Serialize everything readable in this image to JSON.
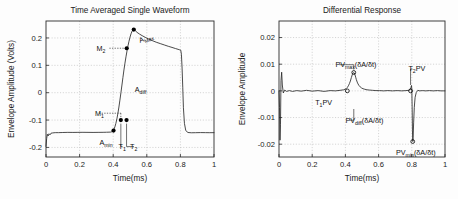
{
  "figure": {
    "panels": [
      "Time Averaged Single Waveform",
      "Differential Response"
    ]
  },
  "chart_data": [
    {
      "type": "line",
      "panel": "left",
      "title": "Time Averaged Single Waveform",
      "xlabel": "Time(ms)",
      "ylabel": "Envelope Amplitude (Volts)",
      "xlim": [
        0,
        1
      ],
      "ylim": [
        -0.235,
        0.262
      ],
      "xticks": [
        0,
        0.2,
        0.4,
        0.6,
        0.8,
        1
      ],
      "xticklabels": [
        "0",
        "0.2",
        "0.4",
        "0.6",
        "0.8",
        "1"
      ],
      "yticks": [
        -0.2,
        -0.1,
        0,
        0.1,
        0.2
      ],
      "yticklabels": [
        "-0.2",
        "-0.1",
        "0",
        "0.1",
        "0.2"
      ],
      "grid": true,
      "legend": "none",
      "series": [
        {
          "name": "envelope",
          "x": [
            0.0,
            0.004,
            0.008,
            0.013,
            0.018,
            0.024,
            0.03,
            0.04,
            0.055,
            0.075,
            0.1,
            0.13,
            0.16,
            0.19,
            0.22,
            0.25,
            0.28,
            0.31,
            0.34,
            0.36,
            0.375,
            0.385,
            0.392,
            0.398,
            0.404,
            0.41,
            0.416,
            0.422,
            0.428,
            0.434,
            0.44,
            0.446,
            0.452,
            0.458,
            0.464,
            0.47,
            0.476,
            0.482,
            0.488,
            0.494,
            0.5,
            0.506,
            0.512,
            0.518,
            0.524,
            0.532,
            0.542,
            0.556,
            0.572,
            0.59,
            0.61,
            0.632,
            0.656,
            0.68,
            0.704,
            0.728,
            0.75,
            0.77,
            0.786,
            0.796,
            0.802,
            0.806,
            0.81,
            0.814,
            0.818,
            0.824,
            0.832,
            0.845,
            0.865,
            0.89,
            0.92,
            0.95,
            0.975,
            1.0
          ],
          "y": [
            -0.196,
            -0.168,
            -0.152,
            -0.158,
            -0.15,
            -0.154,
            -0.148,
            -0.147,
            -0.146,
            -0.146,
            -0.1455,
            -0.145,
            -0.1452,
            -0.145,
            -0.1448,
            -0.145,
            -0.1452,
            -0.145,
            -0.1448,
            -0.1445,
            -0.1442,
            -0.144,
            -0.1425,
            -0.1395,
            -0.134,
            -0.125,
            -0.112,
            -0.0955,
            -0.0755,
            -0.0525,
            -0.027,
            0.0,
            0.028,
            0.056,
            0.083,
            0.108,
            0.131,
            0.152,
            0.171,
            0.188,
            0.203,
            0.215,
            0.2245,
            0.2295,
            0.2305,
            0.2265,
            0.2205,
            0.2145,
            0.2085,
            0.2025,
            0.1965,
            0.1905,
            0.1845,
            0.1795,
            0.1745,
            0.1695,
            0.1655,
            0.1615,
            0.1585,
            0.1565,
            0.1555,
            0.1405,
            0.09,
            0.02,
            -0.055,
            -0.112,
            -0.1385,
            -0.1455,
            -0.1465,
            -0.1462,
            -0.1458,
            -0.146,
            -0.1462,
            -0.146
          ],
          "color": "#2a2a2a"
        }
      ],
      "markers": [
        {
          "name": "A_min-point",
          "x": 0.402,
          "y": -0.1385,
          "style": "filled"
        },
        {
          "name": "T1-point",
          "x": 0.4455,
          "y": -0.1,
          "style": "filled"
        },
        {
          "name": "T2-point",
          "x": 0.4795,
          "y": -0.1,
          "style": "filled"
        },
        {
          "name": "M2-point",
          "x": 0.4805,
          "y": 0.1625,
          "style": "filled"
        },
        {
          "name": "A_Max-point",
          "x": 0.5225,
          "y": 0.2305,
          "style": "filled"
        }
      ],
      "annotations": [
        {
          "name": "M2",
          "base": "M",
          "sub": "2",
          "x_text": 0.3,
          "y_text": 0.1625,
          "leader_to_x": 0.4805,
          "leader_to_y": 0.1625,
          "leader": "dashed"
        },
        {
          "name": "A_Max",
          "base": "A",
          "sub": "Max",
          "x_text": 0.56,
          "y_text": 0.19,
          "leader": "none",
          "rotate": -22
        },
        {
          "name": "A_diff",
          "base": "A",
          "sub": "diff",
          "x_text": 0.528,
          "y_text": 0.012,
          "leader": "none"
        },
        {
          "name": "M1",
          "base": "M",
          "sub": "1",
          "x_text": 0.292,
          "y_text": -0.075,
          "leader_to_x": 0.4455,
          "leader_to_y": -0.1,
          "leader": "dashed"
        },
        {
          "name": "A_min",
          "base": "A",
          "sub": "min",
          "x_text": 0.318,
          "y_text": -0.182,
          "leader": "none"
        },
        {
          "name": "T1",
          "base": "T",
          "sub": "1",
          "x_text": 0.432,
          "y_text": -0.197,
          "leader_to_x": 0.4455,
          "leader_to_y": -0.113,
          "leader": "solid"
        },
        {
          "name": "T2",
          "base": "T",
          "sub": "2",
          "x_text": 0.5,
          "y_text": -0.197,
          "leader_to_x": 0.4795,
          "leader_to_y": -0.113,
          "leader": "solid"
        }
      ]
    },
    {
      "type": "line",
      "panel": "right",
      "title": "Differential Response",
      "xlabel": "Time(ms)",
      "ylabel": "Envelope Amplitude",
      "xlim": [
        0,
        1
      ],
      "ylim": [
        -0.0248,
        0.0262
      ],
      "xticks": [
        0,
        0.2,
        0.4,
        0.6,
        0.8,
        1
      ],
      "xticklabels": [
        "0",
        "0.2",
        "0.4",
        "0.6",
        "0.8",
        "1"
      ],
      "yticks": [
        -0.02,
        -0.01,
        0,
        0.01,
        0.02
      ],
      "yticklabels": [
        "-0.02",
        "-0.01",
        "0",
        "0.01",
        "0.02"
      ],
      "grid": true,
      "legend": "none",
      "series": [
        {
          "name": "derivative",
          "x": [
            0.0,
            0.003,
            0.006,
            0.009,
            0.012,
            0.016,
            0.02,
            0.026,
            0.034,
            0.046,
            0.062,
            0.082,
            0.106,
            0.134,
            0.166,
            0.2,
            0.236,
            0.272,
            0.308,
            0.34,
            0.368,
            0.39,
            0.404,
            0.412,
            0.418,
            0.424,
            0.43,
            0.436,
            0.441,
            0.446,
            0.45,
            0.454,
            0.458,
            0.462,
            0.466,
            0.471,
            0.476,
            0.482,
            0.489,
            0.497,
            0.506,
            0.517,
            0.53,
            0.546,
            0.564,
            0.584,
            0.606,
            0.63,
            0.656,
            0.684,
            0.712,
            0.74,
            0.764,
            0.782,
            0.791,
            0.795,
            0.798,
            0.8,
            0.802,
            0.804,
            0.806,
            0.808,
            0.811,
            0.815,
            0.82,
            0.827,
            0.836,
            0.848,
            0.864,
            0.884,
            0.906,
            0.93,
            0.954,
            0.976,
            1.0
          ],
          "y": [
            0.0,
            -0.0062,
            -0.0185,
            -0.0125,
            0.0038,
            0.007,
            0.0022,
            -0.0008,
            0.0003,
            -0.0002,
            0.0001,
            -0.0002,
            0.0001,
            -0.0001,
            0.0002,
            -0.0001,
            0.0001,
            -0.0002,
            0.0001,
            0.0,
            0.0002,
            0.0004,
            0.0008,
            0.0013,
            0.0019,
            0.0027,
            0.0037,
            0.005,
            0.006,
            0.0067,
            0.0069,
            0.0067,
            0.006,
            0.0051,
            0.0042,
            0.0033,
            0.0026,
            0.002,
            0.0015,
            0.0011,
            0.0008,
            0.0006,
            0.0004,
            0.0003,
            0.0002,
            0.0001,
            0.0001,
            0.0,
            0.0001,
            0.0,
            0.0001,
            0.0,
            0.0001,
            0.0002,
            0.0005,
            0.0013,
            0.002,
            0.0008,
            -0.006,
            -0.015,
            -0.019,
            -0.0176,
            -0.012,
            -0.0062,
            -0.0024,
            -0.0006,
            0.0002,
            0.0,
            0.0001,
            0.0,
            0.0001,
            0.0,
            0.0001,
            0.0,
            0.0
          ],
          "color": "#2a2a2a"
        }
      ],
      "markers": [
        {
          "name": "PVmax-point",
          "x": 0.4505,
          "y": 0.0069,
          "style": "hollow"
        },
        {
          "name": "PVmin-point",
          "x": 0.8055,
          "y": -0.019,
          "style": "hollow"
        },
        {
          "name": "T1PV-point",
          "x": 0.4115,
          "y": 0.0,
          "style": "hollow"
        },
        {
          "name": "T2PV-point",
          "x": 0.7925,
          "y": 0.0,
          "style": "hollow"
        }
      ],
      "annotations": [
        {
          "name": "PV_max",
          "base": "PV",
          "sub": "max",
          "tail": "(δA/δt)",
          "x_text": 0.34,
          "y_text": 0.0098,
          "leader_to_x": 0.4505,
          "leader_to_y": 0.008,
          "leader": "solid"
        },
        {
          "name": "T1PV",
          "base": "T",
          "sub": "1",
          "tail": "PV",
          "x_text": 0.218,
          "y_text": -0.0043,
          "leader": "none"
        },
        {
          "name": "PV_diff",
          "base": "PV",
          "sub": "diff",
          "tail": "(δA/δt)",
          "x_text": 0.4,
          "y_text": -0.011,
          "leader_to_x": 0.4505,
          "leader_to_y": -0.0068,
          "leader": "solid"
        },
        {
          "name": "T2PV",
          "base": "T",
          "sub": "2",
          "tail": "PV",
          "x_text": 0.78,
          "y_text": 0.0082,
          "leader_to_x": 0.7925,
          "leader_to_y": 0.0022,
          "leader": "solid"
        },
        {
          "name": "PV_min",
          "base": "PV",
          "sub": "min",
          "tail": "(δA/δt)",
          "x_text": 0.705,
          "y_text": -0.0232,
          "leader": "none"
        }
      ]
    }
  ]
}
